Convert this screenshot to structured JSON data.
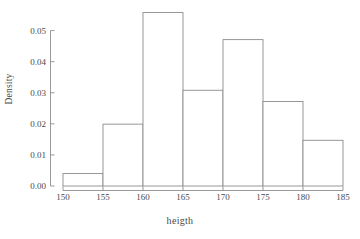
{
  "chart_data": {
    "type": "bar",
    "subtype": "histogram",
    "title": "",
    "xlabel": "heigth",
    "ylabel": "Density",
    "xlim": [
      150,
      185
    ],
    "ylim": [
      0,
      0.056
    ],
    "bin_width": 5,
    "grid": false,
    "legend": null,
    "bin_edges": [
      150,
      155,
      160,
      165,
      170,
      175,
      180,
      185
    ],
    "categories": [
      "150-155",
      "155-160",
      "160-165",
      "165-170",
      "170-175",
      "175-180",
      "180-185"
    ],
    "values": [
      0.004,
      0.0199,
      0.0558,
      0.0308,
      0.0471,
      0.0272,
      0.0147
    ],
    "xticks": [
      150,
      155,
      160,
      165,
      170,
      175,
      180,
      185
    ],
    "xtick_labels": [
      "150",
      "155",
      "160",
      "165",
      "170",
      "175",
      "180",
      "185"
    ],
    "yticks": [
      0.0,
      0.01,
      0.02,
      0.03,
      0.04,
      0.05
    ],
    "ytick_labels": [
      "0.00",
      "0.01",
      "0.02",
      "0.03",
      "0.04",
      "0.05"
    ],
    "bar_fill_color": "#ffffff",
    "bar_edge_color": "#8c8c8c",
    "axis_color": "#8c8c8c",
    "text_color": "#4a4a4a",
    "background_color": "#ffffff"
  }
}
